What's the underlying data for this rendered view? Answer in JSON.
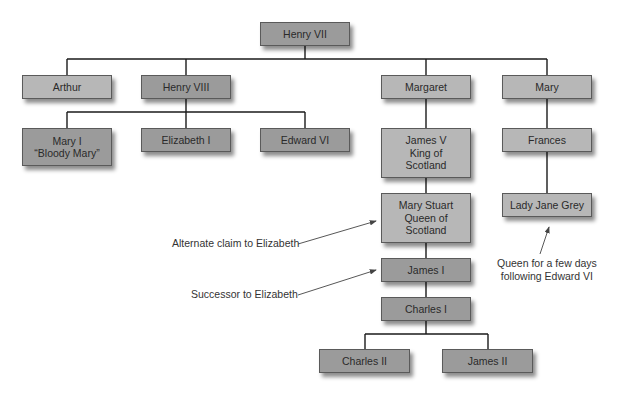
{
  "diagram": {
    "type": "family-tree",
    "nodes": [
      {
        "id": "henry7",
        "label": "Henry VII",
        "x": 260,
        "y": 22,
        "w": 90,
        "h": 24,
        "shade": "dark"
      },
      {
        "id": "arthur",
        "label": "Arthur",
        "x": 22,
        "y": 75,
        "w": 90,
        "h": 24,
        "shade": "light"
      },
      {
        "id": "henry8",
        "label": "Henry VIII",
        "x": 141,
        "y": 75,
        "w": 90,
        "h": 24,
        "shade": "dark"
      },
      {
        "id": "margaret",
        "label": "Margaret",
        "x": 381,
        "y": 75,
        "w": 90,
        "h": 24,
        "shade": "light"
      },
      {
        "id": "mary",
        "label": "Mary",
        "x": 502,
        "y": 75,
        "w": 90,
        "h": 24,
        "shade": "light"
      },
      {
        "id": "mary1",
        "label": "Mary I\n“Bloody Mary”",
        "x": 22,
        "y": 128,
        "w": 90,
        "h": 38,
        "shade": "dark"
      },
      {
        "id": "elizabeth1",
        "label": "Elizabeth I",
        "x": 141,
        "y": 128,
        "w": 90,
        "h": 24,
        "shade": "dark"
      },
      {
        "id": "edward6",
        "label": "Edward VI",
        "x": 260,
        "y": 128,
        "w": 90,
        "h": 24,
        "shade": "dark"
      },
      {
        "id": "james5",
        "label": "James V\nKing of\nScotland",
        "x": 381,
        "y": 128,
        "w": 90,
        "h": 50,
        "shade": "light"
      },
      {
        "id": "frances",
        "label": "Frances",
        "x": 502,
        "y": 128,
        "w": 90,
        "h": 24,
        "shade": "light"
      },
      {
        "id": "marystuart",
        "label": "Mary Stuart\nQueen of\nScotland",
        "x": 381,
        "y": 193,
        "w": 90,
        "h": 50,
        "shade": "light"
      },
      {
        "id": "ladyjane",
        "label": "Lady Jane Grey",
        "x": 502,
        "y": 193,
        "w": 90,
        "h": 24,
        "shade": "light"
      },
      {
        "id": "james1",
        "label": "James I",
        "x": 381,
        "y": 258,
        "w": 90,
        "h": 24,
        "shade": "dark"
      },
      {
        "id": "charles1",
        "label": "Charles I",
        "x": 381,
        "y": 297,
        "w": 90,
        "h": 24,
        "shade": "dark"
      },
      {
        "id": "charles2",
        "label": "Charles II",
        "x": 319,
        "y": 349,
        "w": 91,
        "h": 24,
        "shade": "dark"
      },
      {
        "id": "james2",
        "label": "James II",
        "x": 442,
        "y": 349,
        "w": 91,
        "h": 24,
        "shade": "dark"
      }
    ],
    "connectors": [
      "M305 46 V59",
      "M67 59 H547",
      "M67 59 V75",
      "M186 59 V75",
      "M426 59 V75",
      "M547 59 V75",
      "M186 99 V112",
      "M67 112 H305",
      "M67 112 V128",
      "M186 112 V128",
      "M305 112 V128",
      "M426 99 V128",
      "M547 99 V128",
      "M426 178 V193",
      "M547 152 V193",
      "M426 243 V258",
      "M426 282 V297",
      "M426 321 V334",
      "M365 334 H488",
      "M365 334 V349",
      "M488 334 V349"
    ],
    "annotations": [
      {
        "id": "alt-claim",
        "text": "Alternate claim to Elizabeth",
        "x": 172,
        "y": 237,
        "align": "left",
        "arrow": {
          "x1": 298,
          "y1": 244,
          "x2": 376,
          "y2": 221
        }
      },
      {
        "id": "successor",
        "text": "Successor to Elizabeth",
        "x": 191,
        "y": 288,
        "align": "left",
        "arrow": {
          "x1": 298,
          "y1": 295,
          "x2": 376,
          "y2": 270
        }
      },
      {
        "id": "queen-few-days",
        "text": "Queen for a few days\nfollowing Edward VI",
        "x": 497,
        "y": 257,
        "align": "center",
        "arrow": {
          "x1": 540,
          "y1": 254,
          "x2": 549,
          "y2": 227
        }
      }
    ],
    "colors": {
      "dark": "#9b9b9b",
      "light": "#b7b7b7",
      "line": "#1a1a1a",
      "arrow": "#444444"
    }
  }
}
